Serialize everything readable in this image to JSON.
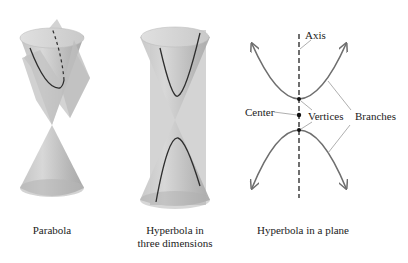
{
  "figures": [
    {
      "id": "parabola",
      "caption_lines": [
        "Parabola"
      ]
    },
    {
      "id": "hyperbola-3d",
      "caption_lines": [
        "Hyperbola in",
        "three dimensions"
      ]
    },
    {
      "id": "hyperbola-plane",
      "caption_lines": [
        "Hyperbola in a plane"
      ],
      "labels": {
        "axis": "Axis",
        "center": "Center",
        "vertices": "Vertices",
        "branches": "Branches"
      }
    }
  ],
  "colors": {
    "cone_light": "#d9d9d9",
    "cone_mid": "#bdbdbd",
    "cone_dark": "#a6a6a6",
    "plane": "#c8c8c8",
    "curve": "#333333",
    "curve_plane": "#6e6e6e",
    "leader": "#9a9a9a"
  }
}
